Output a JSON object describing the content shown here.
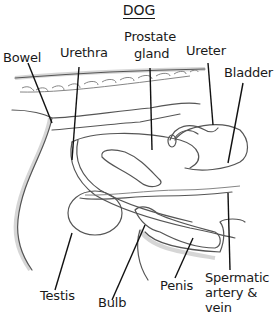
{
  "title": "DOG",
  "labels": {
    "bowel": "Bowel",
    "urethra": "Urethra",
    "prostate_line1": "Prostate",
    "prostate_line2": "gland",
    "ureter": "Ureter",
    "bladder": "Bladder",
    "testis": "Testis",
    "bulb": "Bulb",
    "penis": "Penis",
    "spermatic_line1": "Spermatic",
    "spermatic_line2": "artery &",
    "spermatic_line3": "vein"
  },
  "colors": {
    "ink": "#1a1a1a",
    "outline": "#555555",
    "background": "#ffffff"
  }
}
